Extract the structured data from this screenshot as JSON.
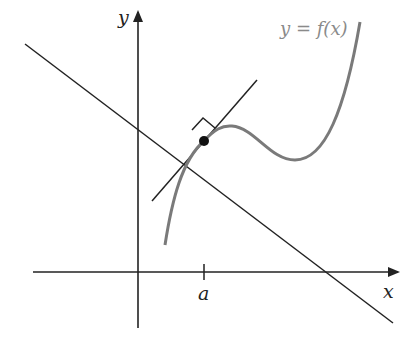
{
  "figure": {
    "curve_label": "y = f(x)",
    "x_axis_label": "x",
    "y_axis_label": "y",
    "tick_label": "a",
    "colors": {
      "axes": "#222222",
      "curve": "#7a7a7a",
      "label_gray": "#8a8a8a"
    }
  }
}
